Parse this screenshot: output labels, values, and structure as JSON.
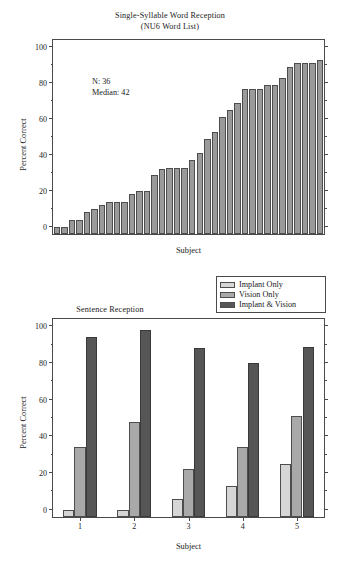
{
  "figure": {
    "panels": [
      "word-reception",
      "sentence-reception"
    ]
  },
  "chart_data": [
    {
      "id": "word-reception",
      "type": "bar",
      "title": "Single-Syllable Word Reception",
      "subtitle": "(NU6 Word List)",
      "xlabel": "Subject",
      "ylabel": "Percent Correct",
      "ylim": [
        -4,
        104
      ],
      "yticks": [
        0,
        20,
        40,
        60,
        80,
        100
      ],
      "ytick_labels": [
        "0",
        "20",
        "40",
        "60",
        "80",
        "100"
      ],
      "yminor_step": 10,
      "grid": false,
      "legend": null,
      "bar_color": "#9a9a9a",
      "bar_edge_color": "#4d4d4d",
      "annotations": [
        {
          "name": "n-annotation",
          "text": "N: 36"
        },
        {
          "name": "median-annotation",
          "text": "Median: 42"
        }
      ],
      "n": 36,
      "median": 42,
      "categories": [
        "1",
        "2",
        "3",
        "4",
        "5",
        "6",
        "7",
        "8",
        "9",
        "10",
        "11",
        "12",
        "13",
        "14",
        "15",
        "16",
        "17",
        "18",
        "19",
        "20",
        "21",
        "22",
        "23",
        "24",
        "25",
        "26",
        "27",
        "28",
        "29",
        "30",
        "31",
        "32",
        "33",
        "34",
        "35",
        "36"
      ],
      "values": [
        0,
        0,
        4,
        4,
        8,
        10,
        12,
        14,
        14,
        14,
        18,
        20,
        20,
        29,
        32,
        33,
        33,
        33,
        37,
        41,
        49,
        53,
        61,
        65,
        69,
        77,
        77,
        77,
        79,
        79,
        83,
        89,
        91,
        91,
        91,
        93
      ]
    },
    {
      "id": "sentence-reception",
      "type": "bar",
      "title": "Sentence Reception",
      "subtitle": "",
      "xlabel": "Subject",
      "ylabel": "Percent Correct",
      "ylim": [
        -4,
        104
      ],
      "yticks": [
        0,
        20,
        40,
        60,
        80,
        100
      ],
      "ytick_labels": [
        "0",
        "20",
        "40",
        "60",
        "80",
        "100"
      ],
      "yminor_step": 10,
      "grid": false,
      "legend_position": "top-right",
      "categories": [
        "1",
        "2",
        "3",
        "4",
        "5"
      ],
      "series": [
        {
          "name": "Implant Only",
          "color": "#d6d6d6",
          "edge_color": "#4d4d4d",
          "values": [
            0,
            0,
            6,
            13,
            25
          ]
        },
        {
          "name": "Vision Only",
          "color": "#a9a9a9",
          "edge_color": "#4d4d4d",
          "values": [
            34,
            48,
            22,
            34,
            51
          ]
        },
        {
          "name": "Implant & Vision",
          "color": "#565656",
          "edge_color": "#3a3a3a",
          "values": [
            94,
            98,
            88,
            80,
            89
          ]
        }
      ]
    }
  ]
}
